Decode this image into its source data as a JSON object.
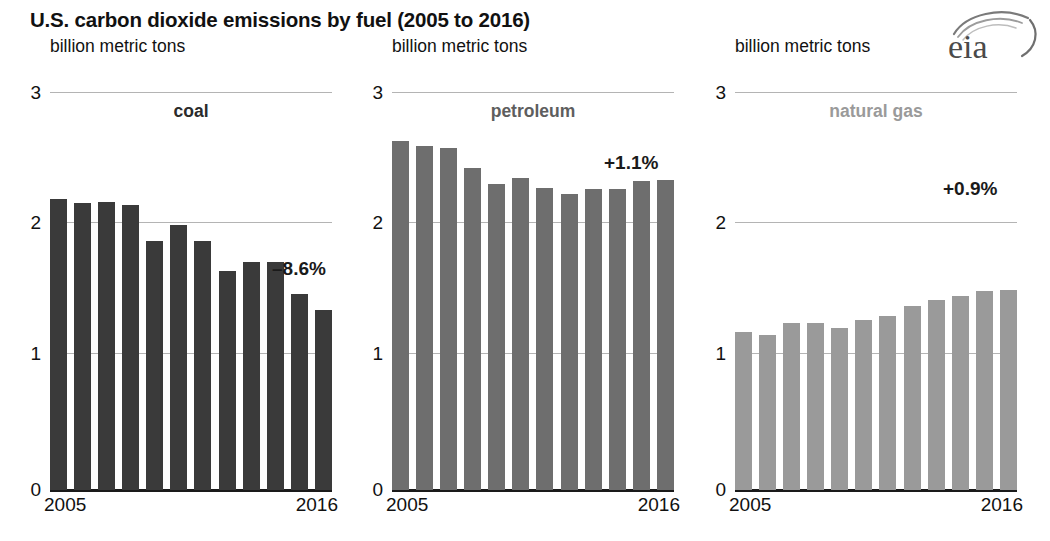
{
  "title": "U.S. carbon dioxide emissions by fuel (2005 to 2016)",
  "logo": {
    "text": "eia",
    "name": "eia-logo"
  },
  "panels": [
    {
      "id": "coal",
      "units": "billion metric tons",
      "name": "coal",
      "color": "#3a3a3a",
      "label_color": "#2b2b2b",
      "change": "–8.6%",
      "x_start": "2005",
      "x_end": "2016",
      "y_ticks": [
        "3",
        "2",
        "1",
        "0"
      ]
    },
    {
      "id": "petroleum",
      "units": "billion metric tons",
      "name": "petroleum",
      "color": "#6e6e6e",
      "label_color": "#5e5e5e",
      "change": "+1.1%",
      "x_start": "2005",
      "x_end": "2016",
      "y_ticks": [
        "3",
        "2",
        "1",
        "0"
      ]
    },
    {
      "id": "natural-gas",
      "units": "billion metric tons",
      "name": "natural gas",
      "color": "#9a9a9a",
      "label_color": "#9a9a9a",
      "change": "+0.9%",
      "x_start": "2005",
      "x_end": "2016",
      "y_ticks": [
        "3",
        "2",
        "1",
        "0"
      ]
    }
  ],
  "chart_data": [
    {
      "type": "bar",
      "title": "coal",
      "subtitle": "U.S. carbon dioxide emissions by fuel (2005 to 2016)",
      "ylabel": "billion metric tons",
      "xlabel": "",
      "ylim": [
        0,
        3
      ],
      "yticks": [
        0,
        1,
        2,
        3
      ],
      "grid": true,
      "legend": "none",
      "annotation": "–8.6%",
      "color": "#3a3a3a",
      "categories": [
        "2005",
        "2006",
        "2007",
        "2008",
        "2009",
        "2010",
        "2011",
        "2012",
        "2013",
        "2014",
        "2015",
        "2016"
      ],
      "tick_labels_shown": [
        "2005",
        "2016"
      ],
      "values": [
        2.19,
        2.16,
        2.17,
        2.15,
        1.88,
        2.0,
        1.88,
        1.65,
        1.72,
        1.72,
        1.48,
        1.36
      ]
    },
    {
      "type": "bar",
      "title": "petroleum",
      "subtitle": "U.S. carbon dioxide emissions by fuel (2005 to 2016)",
      "ylabel": "billion metric tons",
      "xlabel": "",
      "ylim": [
        0,
        3
      ],
      "yticks": [
        0,
        1,
        2,
        3
      ],
      "grid": true,
      "legend": "none",
      "annotation": "+1.1%",
      "color": "#6e6e6e",
      "categories": [
        "2005",
        "2006",
        "2007",
        "2008",
        "2009",
        "2010",
        "2011",
        "2012",
        "2013",
        "2014",
        "2015",
        "2016"
      ],
      "tick_labels_shown": [
        "2005",
        "2016"
      ],
      "values": [
        2.63,
        2.59,
        2.58,
        2.43,
        2.31,
        2.35,
        2.28,
        2.23,
        2.27,
        2.27,
        2.33,
        2.34
      ]
    },
    {
      "type": "bar",
      "title": "natural gas",
      "subtitle": "U.S. carbon dioxide emissions by fuel (2005 to 2016)",
      "ylabel": "billion metric tons",
      "xlabel": "",
      "ylim": [
        0,
        3
      ],
      "yticks": [
        0,
        1,
        2,
        3
      ],
      "grid": true,
      "legend": "none",
      "annotation": "+0.9%",
      "color": "#9a9a9a",
      "categories": [
        "2005",
        "2006",
        "2007",
        "2008",
        "2009",
        "2010",
        "2011",
        "2012",
        "2013",
        "2014",
        "2015",
        "2016"
      ],
      "tick_labels_shown": [
        "2005",
        "2016"
      ],
      "values": [
        1.19,
        1.17,
        1.26,
        1.26,
        1.22,
        1.28,
        1.31,
        1.39,
        1.43,
        1.46,
        1.5,
        1.51
      ]
    }
  ]
}
